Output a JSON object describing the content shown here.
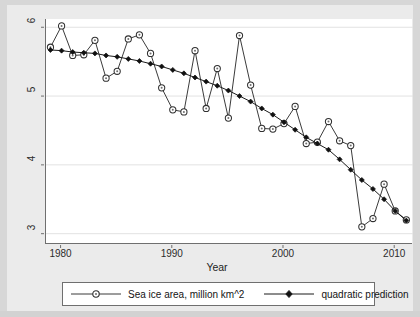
{
  "chart_data": {
    "type": "line",
    "title": "",
    "xlabel": "Year",
    "ylabel": "",
    "xlim": [
      1978.6,
      2011.6
    ],
    "ylim": [
      2.85,
      6.12
    ],
    "xticks": [
      1980,
      1990,
      2000,
      2010
    ],
    "xtick_labels": [
      "1980",
      "1990",
      "2000",
      "2010"
    ],
    "yticks": [
      3,
      4,
      5,
      6
    ],
    "ytick_labels": [
      "3",
      "4",
      "5",
      "6"
    ],
    "grid": "horizontal",
    "legend_position": "below-axis",
    "x": [
      1979,
      1980,
      1981,
      1982,
      1983,
      1984,
      1985,
      1986,
      1987,
      1988,
      1989,
      1990,
      1991,
      1992,
      1993,
      1994,
      1995,
      1996,
      1997,
      1998,
      1999,
      2000,
      2001,
      2002,
      2003,
      2004,
      2005,
      2006,
      2007,
      2008,
      2009,
      2010,
      2011
    ],
    "series": [
      {
        "name": "Sea ice area, million km^2",
        "marker": "open-circle",
        "color": "#3b3b3b",
        "values": [
          5.71,
          6.02,
          5.59,
          5.6,
          5.81,
          5.26,
          5.36,
          5.83,
          5.89,
          5.62,
          5.12,
          4.8,
          4.77,
          5.66,
          4.82,
          5.4,
          4.68,
          5.88,
          5.16,
          4.53,
          4.52,
          4.6,
          4.85,
          4.31,
          4.33,
          4.63,
          4.35,
          4.28,
          3.1,
          3.22,
          3.72,
          3.33,
          3.2
        ]
      },
      {
        "name": "quadratic prediction",
        "marker": "filled-diamond",
        "color": "#1a1a1a",
        "values": [
          5.67,
          5.66,
          5.64,
          5.63,
          5.62,
          5.59,
          5.57,
          5.54,
          5.51,
          5.47,
          5.43,
          5.38,
          5.33,
          5.27,
          5.21,
          5.15,
          5.08,
          5.0,
          4.92,
          4.82,
          4.73,
          4.62,
          4.51,
          4.4,
          4.31,
          4.22,
          4.08,
          3.93,
          3.78,
          3.65,
          3.5,
          3.33,
          3.19
        ]
      }
    ]
  },
  "legend": {
    "entries": [
      {
        "label": "Sea ice area, million km^2",
        "marker": "open-circle"
      },
      {
        "label": "quadratic prediction",
        "marker": "filled-diamond"
      }
    ]
  },
  "axis": {
    "x_title": "Year"
  }
}
